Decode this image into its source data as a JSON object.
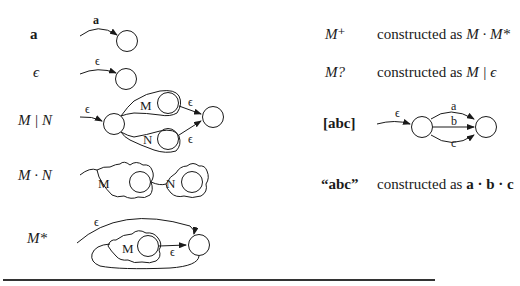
{
  "left_column": {
    "rows": [
      {
        "label": "a",
        "style": "bold",
        "edge_label": "a"
      },
      {
        "label": "ϵ",
        "style": "italic",
        "edge_label": "ϵ"
      },
      {
        "label": "M | N",
        "style": "italic",
        "entry_label": "ϵ",
        "branch_labels": [
          "M",
          "N"
        ],
        "exit_labels": [
          "ϵ",
          "ϵ"
        ]
      },
      {
        "label": "M · N",
        "style": "italic",
        "sub_labels": [
          "M",
          "N"
        ]
      },
      {
        "label": "M*",
        "style": "italic",
        "bypass_label": "ϵ",
        "sub_label": "M",
        "exit_label": "ϵ"
      }
    ]
  },
  "right_column": {
    "rows": [
      {
        "label": "M⁺",
        "style": "italic",
        "desc_prefix": "constructed as ",
        "desc_expr": "M · M*"
      },
      {
        "label": "M?",
        "style": "italic",
        "desc_prefix": "constructed as ",
        "desc_expr": "M | ϵ"
      },
      {
        "label": "[abc]",
        "style": "bold",
        "entry_label": "ϵ",
        "edge_labels": [
          "a",
          "b",
          "c"
        ]
      },
      {
        "label": "“abc”",
        "style": "bold",
        "desc_prefix": "constructed as ",
        "desc_expr": "a · b · c"
      }
    ]
  },
  "colors": {
    "stroke": "#1a1a1a",
    "background": "#ffffff",
    "rule": "#333333"
  }
}
